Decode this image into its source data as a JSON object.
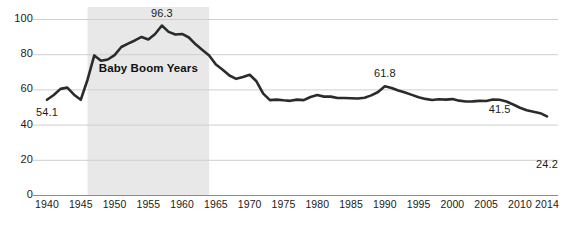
{
  "chart_data": {
    "type": "line",
    "title": "",
    "subtitle": "",
    "xlabel": "",
    "ylabel": "",
    "xlim": [
      1940,
      2014
    ],
    "ylim": [
      0,
      108
    ],
    "grid": true,
    "grid_axis": "y",
    "legend": "none",
    "line_color": "#2b2b2b",
    "band_color": "#e8e8e8",
    "grid_color": "#cfcfcf",
    "axis_color": "#8c8c8c",
    "text_color": "#1b1b1b",
    "yticks": [
      0,
      20,
      40,
      60,
      80,
      100
    ],
    "ytick_labels": [
      "0",
      "20",
      "40",
      "60",
      "80",
      "100"
    ],
    "xticks": [
      1940,
      1945,
      1950,
      1955,
      1960,
      1965,
      1970,
      1975,
      1980,
      1985,
      1990,
      1995,
      2000,
      2005,
      2010,
      2014
    ],
    "xtick_labels": [
      "1940",
      "1945",
      "1950",
      "1955",
      "1960",
      "1965",
      "1970",
      "1975",
      "1980",
      "1985",
      "1990",
      "1995",
      "2000",
      "2005",
      "2010",
      "2014"
    ],
    "shaded_band": {
      "label": "Baby Boom Years",
      "x_start": 1946,
      "x_end": 1964,
      "label_x": 1955,
      "label_y": 72
    },
    "annotations": [
      {
        "text": "54.1",
        "x": 1940,
        "y": 54.1,
        "pos": "below"
      },
      {
        "text": "96.3",
        "x": 1957,
        "y": 96.3,
        "pos": "above"
      },
      {
        "text": "61.8",
        "x": 1990,
        "y": 61.8,
        "pos": "above"
      },
      {
        "text": "41.5",
        "x": 2007,
        "y": 41.5,
        "pos": "above"
      },
      {
        "text": "24.2",
        "x": 2014,
        "y": 24.2,
        "pos": "below"
      }
    ],
    "series": [
      {
        "name": "Births per 1,000 women aged 15-44",
        "x": [
          1940,
          1941,
          1942,
          1943,
          1944,
          1945,
          1946,
          1947,
          1948,
          1949,
          1950,
          1951,
          1952,
          1953,
          1954,
          1955,
          1956,
          1957,
          1958,
          1959,
          1960,
          1961,
          1962,
          1963,
          1964,
          1965,
          1966,
          1967,
          1968,
          1969,
          1970,
          1971,
          1972,
          1973,
          1974,
          1975,
          1976,
          1977,
          1978,
          1979,
          1980,
          1981,
          1982,
          1983,
          1984,
          1985,
          1986,
          1987,
          1988,
          1989,
          1990,
          1991,
          1992,
          1993,
          1994,
          1995,
          1996,
          1997,
          1998,
          1999,
          2000,
          2001,
          2002,
          2003,
          2004,
          2005,
          2006,
          2007,
          2008,
          2009,
          2010,
          2011,
          2012,
          2013,
          2014
        ],
        "y": [
          54.1,
          56.8,
          60.3,
          61.0,
          57.0,
          54.1,
          65.5,
          79.3,
          76.3,
          77.0,
          79.5,
          84.1,
          86.0,
          87.8,
          89.8,
          88.4,
          91.5,
          96.3,
          92.7,
          91.2,
          91.5,
          89.5,
          85.6,
          82.4,
          79.3,
          74.1,
          71.2,
          67.9,
          66.0,
          67.0,
          68.3,
          64.6,
          57.6,
          53.9,
          54.2,
          53.8,
          53.5,
          54.2,
          53.9,
          55.7,
          56.8,
          55.9,
          55.9,
          55.1,
          55.1,
          55.0,
          54.8,
          55.3,
          56.6,
          58.5,
          61.8,
          60.8,
          59.4,
          58.2,
          56.9,
          55.5,
          54.6,
          54.0,
          54.4,
          54.2,
          54.5,
          53.6,
          53.1,
          53.2,
          53.5,
          53.4,
          54.3,
          54.1,
          53.1,
          51.4,
          49.6,
          48.2,
          47.3,
          46.5,
          44.7
        ]
      }
    ],
    "note": ""
  },
  "labels": {
    "band_title": "Baby Boom Years",
    "ytick_0": "0",
    "ytick_1": "20",
    "ytick_2": "40",
    "ytick_3": "60",
    "ytick_4": "80",
    "ytick_5": "100"
  }
}
